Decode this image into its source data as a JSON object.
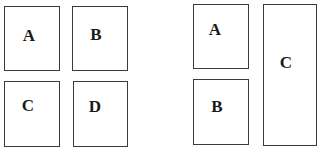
{
  "layout_left": {
    "panels": [
      {
        "label": "A",
        "x": 4,
        "y": 6,
        "w": 56,
        "h": 65,
        "lx": 29,
        "ly": 35
      },
      {
        "label": "B",
        "x": 72,
        "y": 6,
        "w": 56,
        "h": 65,
        "lx": 96,
        "ly": 34
      },
      {
        "label": "C",
        "x": 4,
        "y": 81,
        "w": 56,
        "h": 66,
        "lx": 28,
        "ly": 105
      },
      {
        "label": "D",
        "x": 73,
        "y": 81,
        "w": 55,
        "h": 66,
        "lx": 95,
        "ly": 106
      }
    ]
  },
  "layout_right": {
    "panels": [
      {
        "label": "A",
        "x": 193,
        "y": 4,
        "w": 56,
        "h": 65,
        "lx": 215,
        "ly": 29
      },
      {
        "label": "B",
        "x": 193,
        "y": 79,
        "w": 56,
        "h": 66,
        "lx": 217,
        "ly": 106
      },
      {
        "label": "C",
        "x": 263,
        "y": 4,
        "w": 54,
        "h": 142,
        "lx": 286,
        "ly": 62
      }
    ]
  }
}
